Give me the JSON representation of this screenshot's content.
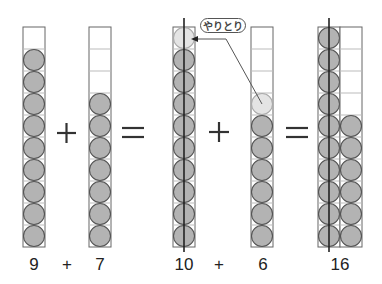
{
  "diagram": {
    "type": "ten-frame addition (making ten)",
    "colors": {
      "counter_fill": "#b3b3b3",
      "counter_light_fill": "#e4e4e4",
      "counter_stroke": "#555555",
      "grid_stroke": "#666666",
      "inner_grid_stroke": "#bbbbbb",
      "line": "#222222"
    },
    "columns": [
      {
        "id": "a",
        "x": 23,
        "filled": 9,
        "light_top_index": null
      },
      {
        "id": "b",
        "x": 89,
        "filled": 7,
        "light_top_index": null
      },
      {
        "id": "c",
        "x": 173,
        "filled": 10,
        "light_top_index": 9,
        "has_center_line": true
      },
      {
        "id": "d",
        "x": 251,
        "filled": 7,
        "light_top_index": 6
      },
      {
        "id": "e",
        "x": 318,
        "filled": 10,
        "has_center_line": true,
        "second_column_filled": 6
      }
    ],
    "callout": {
      "label": "やりとり"
    },
    "equation_top": [
      {
        "symbol": "+",
        "x": 66
      },
      {
        "symbol": "=",
        "x": 133
      },
      {
        "symbol": "+",
        "x": 219
      },
      {
        "symbol": "=",
        "x": 297
      }
    ],
    "equation_bottom": {
      "first": {
        "a": "9",
        "op": "+",
        "b": "7"
      },
      "second": {
        "a": "10",
        "op": "+",
        "b": "6"
      },
      "result": "16"
    }
  }
}
